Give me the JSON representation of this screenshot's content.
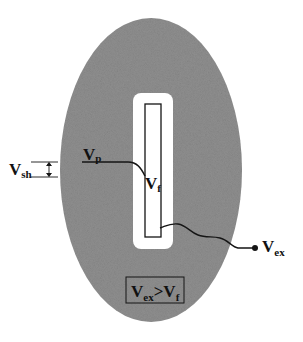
{
  "diagram": {
    "type": "schematic",
    "colors": {
      "background": "#ffffff",
      "ellipse_fill": "#8f8f8f",
      "slot_fill": "#ffffff",
      "stroke": "#151515"
    },
    "labels": {
      "v_sh": {
        "main": "V",
        "sub": "sh"
      },
      "v_p": {
        "main": "V",
        "sub": "p"
      },
      "v_f": {
        "main": "V",
        "sub": "f"
      },
      "v_ex": {
        "main": "V",
        "sub": "ex"
      },
      "condition": {
        "left_main": "V",
        "left_sub": "ex",
        "operator": ">",
        "right_main": "V",
        "right_sub": "f"
      }
    }
  }
}
